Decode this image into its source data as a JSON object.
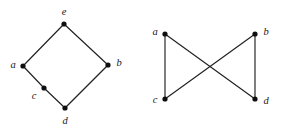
{
  "figure": {
    "background_color": "#ffffff",
    "line_color": "#221f1f",
    "node_color": "#100f0f",
    "label_color": "#1a1717",
    "node_radius": 2.6,
    "width": 283,
    "height": 129
  },
  "graphs": [
    {
      "id": "left-graph",
      "name": "diamond-graph",
      "nodes": [
        {
          "id": "e",
          "label": "e",
          "x": 64,
          "y": 24,
          "label_x": 64,
          "label_y": 12
        },
        {
          "id": "a",
          "label": "a",
          "x": 23,
          "y": 66,
          "label_x": 13,
          "label_y": 65
        },
        {
          "id": "b",
          "label": "b",
          "x": 108,
          "y": 65,
          "label_x": 119,
          "label_y": 63
        },
        {
          "id": "c",
          "label": "c",
          "x": 44,
          "y": 88,
          "label_x": 34,
          "label_y": 96
        },
        {
          "id": "d",
          "label": "d",
          "x": 65,
          "y": 108,
          "label_x": 65,
          "label_y": 121
        }
      ],
      "edges": [
        {
          "from": "a",
          "to": "e"
        },
        {
          "from": "e",
          "to": "b"
        },
        {
          "from": "b",
          "to": "d"
        },
        {
          "from": "a",
          "to": "c"
        },
        {
          "from": "c",
          "to": "d"
        }
      ]
    },
    {
      "id": "right-graph",
      "name": "bowtie-graph",
      "nodes": [
        {
          "id": "a",
          "label": "a",
          "x": 165,
          "y": 34,
          "label_x": 155,
          "label_y": 32
        },
        {
          "id": "b",
          "label": "b",
          "x": 255,
          "y": 34,
          "label_x": 266,
          "label_y": 32
        },
        {
          "id": "c",
          "label": "c",
          "x": 165,
          "y": 99,
          "label_x": 155,
          "label_y": 100
        },
        {
          "id": "d",
          "label": "d",
          "x": 255,
          "y": 99,
          "label_x": 266,
          "label_y": 101
        }
      ],
      "edges": [
        {
          "from": "a",
          "to": "c"
        },
        {
          "from": "b",
          "to": "d"
        },
        {
          "from": "a",
          "to": "d"
        },
        {
          "from": "b",
          "to": "c"
        }
      ]
    }
  ]
}
